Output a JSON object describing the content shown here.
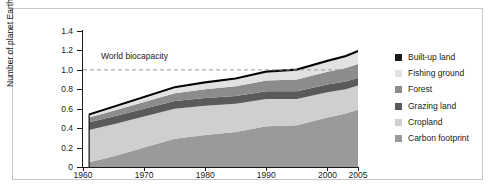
{
  "chart_data": {
    "type": "area",
    "title": "",
    "xlabel": "",
    "ylabel": "Number of planet Earths",
    "xlim": [
      1960,
      2005
    ],
    "ylim": [
      0,
      1.4
    ],
    "grid": false,
    "legend_position": "right",
    "stacked": true,
    "x_ticks": [
      "1960",
      "1970",
      "1980",
      "1990",
      "2000",
      "2005"
    ],
    "x_tick_values": [
      1960,
      1970,
      1980,
      1990,
      2000,
      2005
    ],
    "y_ticks": [
      "0",
      "0.2",
      "0.4",
      "0.6",
      "0.8",
      "1.0",
      "1.2",
      "1.4"
    ],
    "y_tick_values": [
      0,
      0.2,
      0.4,
      0.6,
      0.8,
      1.0,
      1.2,
      1.4
    ],
    "annotation": {
      "label": "World biocapacity",
      "value": 1.0,
      "style": "dashed-horizontal-line"
    },
    "x": [
      1961,
      1965,
      1970,
      1975,
      1980,
      1985,
      1990,
      1995,
      2000,
      2003,
      2005
    ],
    "series": [
      {
        "name": "Carbon footprint",
        "color": "#9a9a9a",
        "values": [
          0.05,
          0.11,
          0.2,
          0.29,
          0.33,
          0.36,
          0.42,
          0.43,
          0.51,
          0.55,
          0.59
        ]
      },
      {
        "name": "Cropland",
        "color": "#cfcfcf",
        "values": [
          0.33,
          0.33,
          0.32,
          0.31,
          0.3,
          0.29,
          0.28,
          0.27,
          0.26,
          0.25,
          0.25
        ]
      },
      {
        "name": "Grazing land",
        "color": "#5a5a5a",
        "values": [
          0.08,
          0.08,
          0.08,
          0.08,
          0.08,
          0.08,
          0.08,
          0.08,
          0.08,
          0.08,
          0.08
        ]
      },
      {
        "name": "Forest",
        "color": "#8c8c8c",
        "values": [
          0.05,
          0.06,
          0.07,
          0.08,
          0.09,
          0.1,
          0.11,
          0.12,
          0.13,
          0.14,
          0.14
        ]
      },
      {
        "name": "Fishing ground",
        "color": "#e2e2e2",
        "values": [
          0.02,
          0.03,
          0.04,
          0.05,
          0.06,
          0.07,
          0.08,
          0.09,
          0.1,
          0.11,
          0.12
        ]
      },
      {
        "name": "Built-up land",
        "color": "#1a1a1a",
        "values": [
          0.012,
          0.012,
          0.013,
          0.013,
          0.014,
          0.014,
          0.015,
          0.015,
          0.016,
          0.016,
          0.016
        ]
      }
    ],
    "totals": [
      0.54,
      0.62,
      0.72,
      0.82,
      0.87,
      0.91,
      1.0,
      1.02,
      1.1,
      1.18,
      1.29
    ]
  },
  "legend": {
    "items": [
      {
        "label": "Built-up land",
        "color": "#1a1a1a"
      },
      {
        "label": "Fishing ground",
        "color": "#e2e2e2"
      },
      {
        "label": "Forest",
        "color": "#8c8c8c"
      },
      {
        "label": "Grazing land",
        "color": "#5a5a5a"
      },
      {
        "label": "Cropland",
        "color": "#cfcfcf"
      },
      {
        "label": "Carbon footprint",
        "color": "#9a9a9a"
      }
    ]
  }
}
